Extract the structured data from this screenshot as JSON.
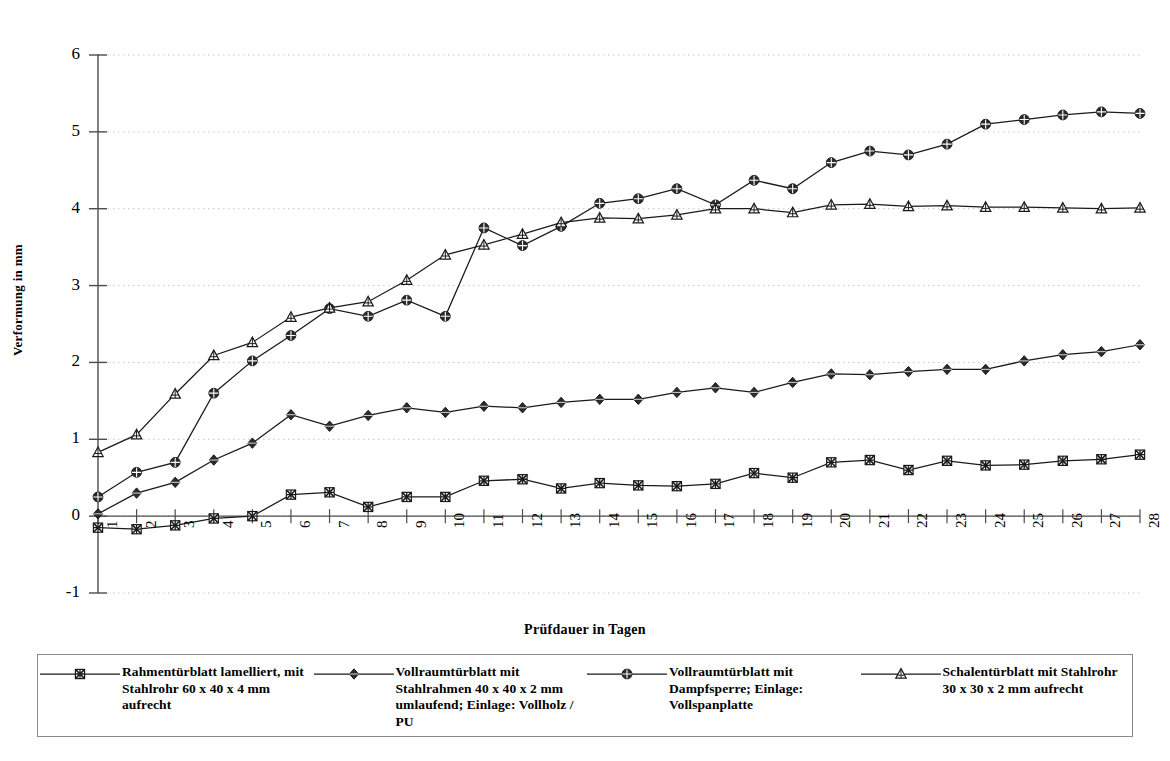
{
  "chart_data": {
    "type": "line",
    "title": "",
    "xlabel": "Prüfdauer in Tagen",
    "ylabel": "Verformung in mm",
    "xlim": [
      1,
      28
    ],
    "ylim": [
      -1,
      6
    ],
    "yticks": [
      -1,
      0,
      1,
      2,
      3,
      4,
      5,
      6
    ],
    "grid": "horizontal-dotted",
    "legend_position": "bottom",
    "x": [
      1,
      2,
      3,
      4,
      5,
      6,
      7,
      8,
      9,
      10,
      11,
      12,
      13,
      14,
      15,
      16,
      17,
      18,
      19,
      20,
      21,
      22,
      23,
      24,
      25,
      26,
      27,
      28
    ],
    "categories": [
      "1",
      "2",
      "3",
      "4",
      "5",
      "6",
      "7",
      "8",
      "9",
      "10",
      "11",
      "12",
      "13",
      "14",
      "15",
      "16",
      "17",
      "18",
      "19",
      "20",
      "21",
      "22",
      "23",
      "24",
      "25",
      "26",
      "27",
      "28"
    ],
    "series": [
      {
        "name": "Rahmentürblatt lamelliert, mit Stahlrohr 60 x 40 x 4 mm aufrecht",
        "marker": "square",
        "values": [
          -0.15,
          -0.17,
          -0.12,
          -0.03,
          0.0,
          0.28,
          0.31,
          0.12,
          0.25,
          0.25,
          0.46,
          0.48,
          0.36,
          0.43,
          0.4,
          0.39,
          0.42,
          0.56,
          0.5,
          0.7,
          0.73,
          0.6,
          0.72,
          0.66,
          0.67,
          0.72,
          0.74,
          0.8
        ]
      },
      {
        "name": "Vollraumtürblatt mit Stahlrahmen 40 x 40 x 2 mm umlaufend; Einlage: Vollholz / PU",
        "marker": "diamond",
        "values": [
          0.03,
          0.3,
          0.44,
          0.73,
          0.95,
          1.32,
          1.17,
          1.31,
          1.41,
          1.35,
          1.43,
          1.41,
          1.48,
          1.52,
          1.52,
          1.61,
          1.67,
          1.61,
          1.74,
          1.85,
          1.84,
          1.88,
          1.91,
          1.91,
          2.02,
          2.1,
          2.14,
          2.23
        ]
      },
      {
        "name": "Vollraumtürblatt mit Dampfsperre; Einlage: Vollspanplatte",
        "marker": "circle",
        "values": [
          0.25,
          0.57,
          0.7,
          1.6,
          2.02,
          2.35,
          2.7,
          2.6,
          2.81,
          2.6,
          3.75,
          3.52,
          3.77,
          4.07,
          4.13,
          4.26,
          4.05,
          4.37,
          4.26,
          4.6,
          4.75,
          4.7,
          4.84,
          5.1,
          5.16,
          5.22,
          5.26,
          5.24
        ]
      },
      {
        "name": "Schalentürblatt mit Stahlrohr 30 x 30 x 2 mm aufrecht",
        "marker": "triangle",
        "values": [
          0.83,
          1.06,
          1.59,
          2.09,
          2.26,
          2.59,
          2.71,
          2.79,
          3.07,
          3.4,
          3.53,
          3.67,
          3.82,
          3.88,
          3.87,
          3.92,
          4.0,
          4.0,
          3.95,
          4.05,
          4.06,
          4.03,
          4.04,
          4.02,
          4.02,
          4.01,
          4.0,
          4.01
        ]
      }
    ]
  },
  "legend": {
    "entries": [
      {
        "label": "Rahmentürblatt lamelliert, mit Stahlrohr 60 x 40 x 4 mm aufrecht",
        "marker": "square"
      },
      {
        "label": "Vollraumtürblatt mit Stahlrahmen 40 x 40 x 2 mm umlaufend; Einlage: Vollholz / PU",
        "marker": "diamond"
      },
      {
        "label": "Vollraumtürblatt mit Dampfsperre; Einlage: Vollspanplatte",
        "marker": "circle"
      },
      {
        "label": "Schalentürblatt mit Stahlrohr 30 x 30 x 2 mm aufrecht",
        "marker": "triangle"
      }
    ]
  },
  "colors": {
    "line": "#1a1a1a",
    "axis": "#4d4d4d",
    "grid": "#c8c8c8",
    "background": "#ffffff",
    "legend_border": "#8a8a8a"
  }
}
